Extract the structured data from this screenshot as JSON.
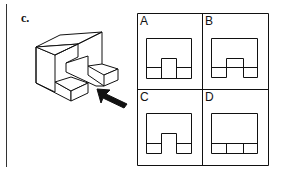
{
  "figure": {
    "label": "c.",
    "object_description": "isometric U-shaped block with two protruding steps, viewed from direction of arrow",
    "arrow": "viewing-direction arrow pointing up-left toward object",
    "options": [
      {
        "letter": "A",
        "description": "outer rectangle with raised center notch spanning full height of bottom strip, bottom strip divided into left, center, right cells"
      },
      {
        "letter": "B",
        "description": "outer rectangle with center notch; horizontal line crosses through notch; left and right bottom cells"
      },
      {
        "letter": "C",
        "description": "outer rectangle with open center notch; left and right small bottom cells"
      },
      {
        "letter": "D",
        "description": "outer rectangle with bottom strip divided into three equal cells"
      }
    ]
  }
}
